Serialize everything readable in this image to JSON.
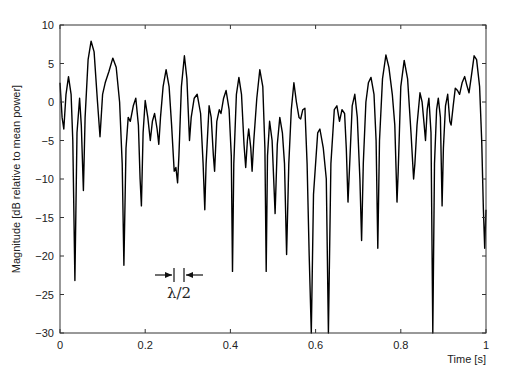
{
  "chart_data": {
    "type": "line",
    "title": "",
    "xlabel": "Time [s]",
    "ylabel": "Magnitude [dB relative to mean power]",
    "xlim": [
      0,
      1
    ],
    "ylim": [
      -30,
      10
    ],
    "grid": false,
    "legend": null,
    "x_ticks": [
      "0",
      "0.2",
      "0.4",
      "0.6",
      "0.8",
      "1"
    ],
    "y_ticks": [
      "10",
      "5",
      "0",
      "-5",
      "-10",
      "-15",
      "-20",
      "-25",
      "-30"
    ],
    "annotation": {
      "text": "λ/2",
      "x_start": 0.265,
      "x_end": 0.29,
      "y": -24
    },
    "series": [
      {
        "name": "fading envelope",
        "color": "#000000",
        "points": [
          [
            0.0,
            2.5
          ],
          [
            0.005,
            -2.0
          ],
          [
            0.009,
            -3.5
          ],
          [
            0.014,
            1.0
          ],
          [
            0.02,
            3.3
          ],
          [
            0.026,
            1.0
          ],
          [
            0.03,
            -5.0
          ],
          [
            0.035,
            -23.2
          ],
          [
            0.04,
            -4.0
          ],
          [
            0.046,
            0.5
          ],
          [
            0.05,
            -3.0
          ],
          [
            0.055,
            -11.5
          ],
          [
            0.059,
            -2.0
          ],
          [
            0.066,
            5.5
          ],
          [
            0.073,
            7.9
          ],
          [
            0.08,
            6.5
          ],
          [
            0.088,
            0.0
          ],
          [
            0.094,
            -4.5
          ],
          [
            0.1,
            1.0
          ],
          [
            0.106,
            2.5
          ],
          [
            0.115,
            4.0
          ],
          [
            0.124,
            5.7
          ],
          [
            0.132,
            4.5
          ],
          [
            0.14,
            0.0
          ],
          [
            0.146,
            -8.0
          ],
          [
            0.15,
            -21.2
          ],
          [
            0.155,
            -6.0
          ],
          [
            0.16,
            -2.0
          ],
          [
            0.165,
            -2.5
          ],
          [
            0.172,
            -0.5
          ],
          [
            0.178,
            0.5
          ],
          [
            0.184,
            -3.0
          ],
          [
            0.188,
            -10.0
          ],
          [
            0.191,
            -13.5
          ],
          [
            0.195,
            -4.0
          ],
          [
            0.2,
            0.2
          ],
          [
            0.206,
            -2.0
          ],
          [
            0.212,
            -5.0
          ],
          [
            0.217,
            -2.5
          ],
          [
            0.222,
            -1.5
          ],
          [
            0.228,
            -3.5
          ],
          [
            0.232,
            -5.5
          ],
          [
            0.236,
            -2.0
          ],
          [
            0.242,
            2.0
          ],
          [
            0.249,
            4.2
          ],
          [
            0.256,
            2.0
          ],
          [
            0.262,
            -3.0
          ],
          [
            0.268,
            -9.0
          ],
          [
            0.272,
            -8.5
          ],
          [
            0.276,
            -10.5
          ],
          [
            0.279,
            -7.0
          ],
          [
            0.285,
            2.0
          ],
          [
            0.292,
            6.0
          ],
          [
            0.298,
            3.0
          ],
          [
            0.304,
            -5.0
          ],
          [
            0.308,
            -2.0
          ],
          [
            0.315,
            0.5
          ],
          [
            0.322,
            1.0
          ],
          [
            0.33,
            -1.5
          ],
          [
            0.336,
            -8.0
          ],
          [
            0.34,
            -14.0
          ],
          [
            0.343,
            -8.0
          ],
          [
            0.35,
            -0.5
          ],
          [
            0.355,
            -2.0
          ],
          [
            0.36,
            -7.0
          ],
          [
            0.363,
            -9.0
          ],
          [
            0.368,
            -2.5
          ],
          [
            0.374,
            -1.0
          ],
          [
            0.378,
            -1.5
          ],
          [
            0.384,
            0.5
          ],
          [
            0.39,
            1.5
          ],
          [
            0.397,
            -1.0
          ],
          [
            0.402,
            -7.0
          ],
          [
            0.405,
            -22.0
          ],
          [
            0.408,
            -8.0
          ],
          [
            0.414,
            1.0
          ],
          [
            0.42,
            3.2
          ],
          [
            0.426,
            1.0
          ],
          [
            0.432,
            -5.5
          ],
          [
            0.436,
            -8.5
          ],
          [
            0.44,
            -5.0
          ],
          [
            0.443,
            -3.5
          ],
          [
            0.448,
            -6.0
          ],
          [
            0.451,
            -9.0
          ],
          [
            0.455,
            -5.0
          ],
          [
            0.462,
            0.5
          ],
          [
            0.469,
            4.2
          ],
          [
            0.476,
            2.0
          ],
          [
            0.481,
            -6.0
          ],
          [
            0.484,
            -22.0
          ],
          [
            0.487,
            -7.0
          ],
          [
            0.492,
            -2.5
          ],
          [
            0.498,
            -5.0
          ],
          [
            0.505,
            -14.5
          ],
          [
            0.51,
            -5.5
          ],
          [
            0.516,
            -2.0
          ],
          [
            0.522,
            -4.0
          ],
          [
            0.527,
            -8.0
          ],
          [
            0.532,
            -19.8
          ],
          [
            0.537,
            -8.0
          ],
          [
            0.543,
            -1.0
          ],
          [
            0.549,
            2.5
          ],
          [
            0.555,
            0.0
          ],
          [
            0.561,
            -2.0
          ],
          [
            0.565,
            -2.2
          ],
          [
            0.57,
            -1.0
          ],
          [
            0.575,
            -0.8
          ],
          [
            0.58,
            -8.0
          ],
          [
            0.585,
            -20.0
          ],
          [
            0.59,
            -30.0
          ],
          [
            0.595,
            -12.0
          ],
          [
            0.605,
            -4.0
          ],
          [
            0.61,
            -3.5
          ],
          [
            0.618,
            -6.0
          ],
          [
            0.625,
            -10.0
          ],
          [
            0.63,
            -30.0
          ],
          [
            0.636,
            -8.0
          ],
          [
            0.644,
            -1.0
          ],
          [
            0.65,
            -0.5
          ],
          [
            0.656,
            -2.5
          ],
          [
            0.662,
            -1.0
          ],
          [
            0.668,
            -1.5
          ],
          [
            0.672,
            -6.0
          ],
          [
            0.676,
            -13.0
          ],
          [
            0.68,
            -8.0
          ],
          [
            0.686,
            -0.5
          ],
          [
            0.692,
            1.0
          ],
          [
            0.698,
            -2.0
          ],
          [
            0.704,
            -10.0
          ],
          [
            0.708,
            -18.0
          ],
          [
            0.712,
            -8.0
          ],
          [
            0.718,
            0.0
          ],
          [
            0.724,
            2.5
          ],
          [
            0.73,
            3.2
          ],
          [
            0.737,
            1.0
          ],
          [
            0.742,
            -5.0
          ],
          [
            0.746,
            -19.0
          ],
          [
            0.75,
            -5.0
          ],
          [
            0.757,
            3.0
          ],
          [
            0.765,
            6.1
          ],
          [
            0.772,
            4.5
          ],
          [
            0.78,
            1.0
          ],
          [
            0.786,
            -3.0
          ],
          [
            0.791,
            -13.0
          ],
          [
            0.794,
            -9.0
          ],
          [
            0.8,
            2.0
          ],
          [
            0.808,
            5.4
          ],
          [
            0.816,
            3.0
          ],
          [
            0.824,
            -4.0
          ],
          [
            0.83,
            -10.0
          ],
          [
            0.833,
            -8.0
          ],
          [
            0.838,
            -3.0
          ],
          [
            0.845,
            1.2
          ],
          [
            0.85,
            0.0
          ],
          [
            0.855,
            -3.0
          ],
          [
            0.858,
            -5.0
          ],
          [
            0.862,
            -1.0
          ],
          [
            0.866,
            0.5
          ],
          [
            0.871,
            -4.0
          ],
          [
            0.875,
            -30.0
          ],
          [
            0.879,
            -8.0
          ],
          [
            0.884,
            -1.0
          ],
          [
            0.888,
            0.5
          ],
          [
            0.893,
            -2.0
          ],
          [
            0.897,
            -13.5
          ],
          [
            0.9,
            -6.0
          ],
          [
            0.905,
            -0.5
          ],
          [
            0.91,
            1.0
          ],
          [
            0.915,
            -2.5
          ],
          [
            0.918,
            -3.0
          ],
          [
            0.923,
            -0.5
          ],
          [
            0.928,
            1.8
          ],
          [
            0.933,
            1.5
          ],
          [
            0.938,
            1.0
          ],
          [
            0.944,
            2.5
          ],
          [
            0.95,
            3.3
          ],
          [
            0.955,
            2.2
          ],
          [
            0.96,
            1.2
          ],
          [
            0.966,
            3.5
          ],
          [
            0.972,
            6.0
          ],
          [
            0.978,
            5.5
          ],
          [
            0.985,
            2.0
          ],
          [
            0.99,
            -5.0
          ],
          [
            0.994,
            -14.0
          ],
          [
            0.997,
            -19.0
          ],
          [
            1.0,
            -14.0
          ]
        ]
      }
    ]
  },
  "plot": {
    "x_axis_label": "Time [s]",
    "y_axis_label": "Magnitude [dB relative to mean power]",
    "annotation_text": "λ/2"
  }
}
